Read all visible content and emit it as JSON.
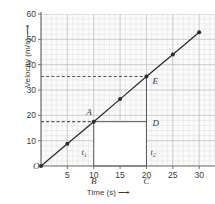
{
  "chart_data": {
    "type": "line",
    "title": "",
    "xlabel": "Time (s)",
    "ylabel": "Velocity (m/s)",
    "xlim": [
      0,
      33
    ],
    "ylim": [
      0,
      60
    ],
    "xticks": [
      5,
      10,
      15,
      20,
      25,
      30
    ],
    "yticks": [
      10,
      20,
      30,
      40,
      50,
      60
    ],
    "origin_label": "O",
    "grid": true,
    "grid_minor_step_x": 1,
    "grid_minor_step_y": 2,
    "grid_major_step_x": 5,
    "grid_major_step_y": 10,
    "legend": null,
    "series": [
      {
        "name": "velocity",
        "x": [
          0,
          5,
          10,
          15,
          20,
          25,
          30
        ],
        "values": [
          0,
          8.8,
          17.5,
          26.4,
          35.3,
          44.0,
          52.8
        ],
        "marker": "circle",
        "color": "#2b2b2b"
      }
    ],
    "points": [
      {
        "label": "A",
        "x": 10,
        "y": 17.5,
        "label_dx": -2,
        "label_dy": -7
      },
      {
        "label": "B",
        "x": 10,
        "y": 0,
        "label_dx": 0,
        "label_dy": 18
      },
      {
        "label": "C",
        "x": 20,
        "y": 0,
        "label_dx": 0,
        "label_dy": 18
      },
      {
        "label": "D",
        "x": 20,
        "y": 17.5,
        "label_dx": 6,
        "label_dy": 4
      },
      {
        "label": "E",
        "x": 20,
        "y": 35.3,
        "label_dx": 6,
        "label_dy": 7
      }
    ],
    "interval_labels": [
      {
        "label": "t1",
        "text": "t₁",
        "x": 10,
        "y": 4.2,
        "dx": -7
      },
      {
        "label": "t2",
        "text": "t₂",
        "x": 20,
        "y": 4.2,
        "dx": 4
      }
    ],
    "dashed_guides": [
      {
        "name": "guide-v1",
        "y": 17.5,
        "from_x": 0,
        "to_x": 10
      },
      {
        "name": "guide-v2",
        "y": 35.3,
        "from_x": 0,
        "to_x": 20
      }
    ],
    "solid_guides": [
      {
        "name": "segment-ab",
        "x1": 10,
        "y1": 17.5,
        "x2": 10,
        "y2": 0
      },
      {
        "name": "segment-ad",
        "x1": 10,
        "y1": 17.5,
        "x2": 20,
        "y2": 17.5
      },
      {
        "name": "segment-ec",
        "x1": 20,
        "y1": 35.3,
        "x2": 20,
        "y2": 0
      },
      {
        "name": "segment-bc",
        "x1": 10,
        "y1": 0,
        "x2": 20,
        "y2": 0
      }
    ],
    "colors": {
      "line": "#2b2b2b",
      "axis": "#6e6e6e",
      "grid_minor": "#dedede",
      "grid_major": "#c2c2c2",
      "guide": "#555555",
      "text": "#3a3a3a",
      "plot_background": "#fbfbfb",
      "rect_fill": "#ffffff"
    }
  },
  "axes": {
    "y_title": "Velocity (m/s)",
    "x_title": "Time (s)",
    "y_arrow": "⟶",
    "x_arrow": "⟶"
  }
}
